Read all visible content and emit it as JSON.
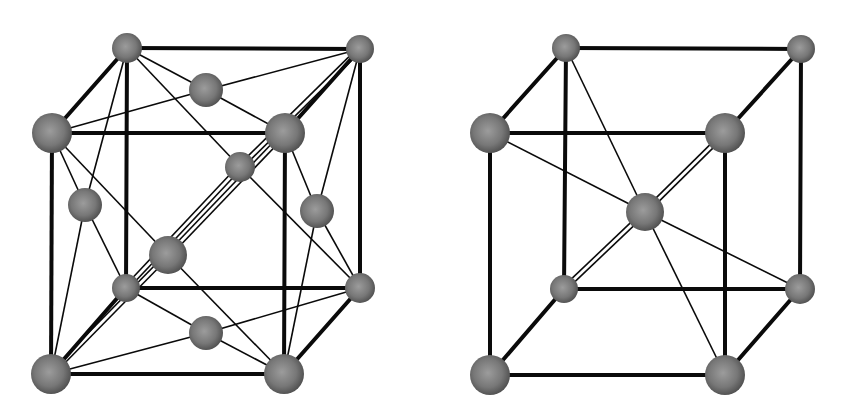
{
  "diagrams": [
    {
      "id": "fcc",
      "name": "face-centered-cubic-lattice",
      "atoms": [
        {
          "key": "btl",
          "x": 127,
          "y": 48,
          "r": 15
        },
        {
          "key": "btr",
          "x": 360,
          "y": 49,
          "r": 14
        },
        {
          "key": "ftl",
          "x": 52,
          "y": 133,
          "r": 20
        },
        {
          "key": "ftr",
          "x": 285,
          "y": 133,
          "r": 20
        },
        {
          "key": "bbl",
          "x": 126,
          "y": 288,
          "r": 14
        },
        {
          "key": "bbr",
          "x": 360,
          "y": 288,
          "r": 15
        },
        {
          "key": "fbl",
          "x": 51,
          "y": 374,
          "r": 20
        },
        {
          "key": "fbr",
          "x": 284,
          "y": 374,
          "r": 20
        },
        {
          "key": "top",
          "x": 206,
          "y": 90,
          "r": 17
        },
        {
          "key": "bot",
          "x": 206,
          "y": 333,
          "r": 17
        },
        {
          "key": "left",
          "x": 85,
          "y": 205,
          "r": 17
        },
        {
          "key": "right",
          "x": 317,
          "y": 211,
          "r": 17
        },
        {
          "key": "front",
          "x": 168,
          "y": 255,
          "r": 19
        },
        {
          "key": "back",
          "x": 240,
          "y": 167,
          "r": 15
        }
      ],
      "edges": [
        [
          "btl",
          "btr"
        ],
        [
          "ftl",
          "ftr"
        ],
        [
          "bbl",
          "bbr"
        ],
        [
          "fbl",
          "fbr"
        ],
        [
          "btl",
          "ftl"
        ],
        [
          "btr",
          "ftr"
        ],
        [
          "bbl",
          "fbl"
        ],
        [
          "bbr",
          "fbr"
        ],
        [
          "btl",
          "bbl"
        ],
        [
          "btr",
          "bbr"
        ],
        [
          "ftl",
          "fbl"
        ],
        [
          "ftr",
          "fbr"
        ]
      ],
      "thin": [
        [
          "btl",
          "top"
        ],
        [
          "btr",
          "top"
        ],
        [
          "ftl",
          "top"
        ],
        [
          "ftr",
          "top"
        ],
        [
          "bbl",
          "bot"
        ],
        [
          "bbr",
          "bot"
        ],
        [
          "fbl",
          "bot"
        ],
        [
          "fbr",
          "bot"
        ],
        [
          "btl",
          "left"
        ],
        [
          "ftl",
          "left"
        ],
        [
          "bbl",
          "left"
        ],
        [
          "fbl",
          "left"
        ],
        [
          "btr",
          "right"
        ],
        [
          "ftr",
          "right"
        ],
        [
          "bbr",
          "right"
        ],
        [
          "fbr",
          "right"
        ],
        [
          "ftl",
          "front"
        ],
        [
          "fbr",
          "front"
        ],
        [
          "btl",
          "back"
        ],
        [
          "bbr",
          "back"
        ]
      ],
      "double": [
        [
          "fbl",
          "front"
        ],
        [
          "front",
          "ftr"
        ],
        [
          "bbl",
          "back"
        ],
        [
          "back",
          "btr"
        ]
      ]
    },
    {
      "id": "bcc",
      "name": "body-centered-cubic-lattice",
      "atoms": [
        {
          "key": "btl",
          "x": 566,
          "y": 48,
          "r": 14
        },
        {
          "key": "btr",
          "x": 801,
          "y": 49,
          "r": 14
        },
        {
          "key": "ftl",
          "x": 490,
          "y": 133,
          "r": 20
        },
        {
          "key": "ftr",
          "x": 725,
          "y": 133,
          "r": 20
        },
        {
          "key": "bbl",
          "x": 564,
          "y": 289,
          "r": 14
        },
        {
          "key": "bbr",
          "x": 800,
          "y": 289,
          "r": 15
        },
        {
          "key": "fbl",
          "x": 490,
          "y": 375,
          "r": 20
        },
        {
          "key": "fbr",
          "x": 725,
          "y": 375,
          "r": 20
        },
        {
          "key": "center",
          "x": 645,
          "y": 212,
          "r": 19
        }
      ],
      "edges": [
        [
          "btl",
          "btr"
        ],
        [
          "ftl",
          "ftr"
        ],
        [
          "bbl",
          "bbr"
        ],
        [
          "fbl",
          "fbr"
        ],
        [
          "btl",
          "ftl"
        ],
        [
          "btr",
          "ftr"
        ],
        [
          "bbl",
          "fbl"
        ],
        [
          "bbr",
          "fbr"
        ],
        [
          "btl",
          "bbl"
        ],
        [
          "btr",
          "bbr"
        ],
        [
          "ftl",
          "fbl"
        ],
        [
          "ftr",
          "fbr"
        ]
      ],
      "thin": [
        [
          "btl",
          "center"
        ],
        [
          "ftl",
          "center"
        ],
        [
          "bbr",
          "center"
        ],
        [
          "fbr",
          "center"
        ]
      ],
      "double": [
        [
          "ftr",
          "center"
        ],
        [
          "center",
          "bbl"
        ]
      ]
    }
  ],
  "colors": {
    "background": "#ffffff",
    "bond": "#0a0a0a",
    "atom_highlight": "#9c9c9c",
    "atom_mid": "#777777",
    "atom_shadow": "#4a4a4a"
  }
}
